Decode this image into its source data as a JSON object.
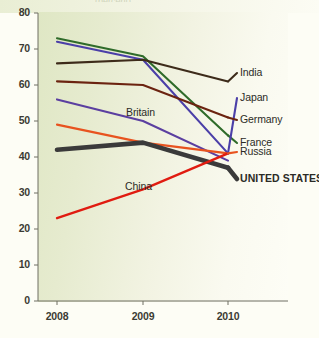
{
  "figure": {
    "background_color": "#fdfdf5",
    "plot_background_color": "#e3e9c8",
    "cropped_title_fragment": "(percent)"
  },
  "axes": {
    "y_ticks": [
      "80",
      "70",
      "60",
      "50",
      "40",
      "30",
      "20",
      "10",
      "0"
    ],
    "x_ticks": [
      "2008",
      "2009",
      "2010"
    ]
  },
  "inline_annotations": [
    {
      "name": "britain-inline-label",
      "text": "Britain"
    },
    {
      "name": "china-inline-label",
      "text": "China"
    }
  ],
  "legend": {
    "position": "right",
    "entries": [
      {
        "label": "India",
        "color": "#3d2b1a"
      },
      {
        "label": "Japan",
        "color": "#4b3fa8"
      },
      {
        "label": "Germany",
        "color": "#6b2310"
      },
      {
        "label": "France",
        "color": "#2f6b2a"
      },
      {
        "label": "Russia",
        "color": "#e8531f"
      },
      {
        "label": "UNITED STATES",
        "color": "#3a3a3a"
      }
    ]
  },
  "chart_data": {
    "type": "line",
    "title": "",
    "subtitle": "",
    "xlabel": "",
    "ylabel": "",
    "x": [
      "2008",
      "2009",
      "2010"
    ],
    "ylim": [
      0,
      80
    ],
    "xlim": [
      "2008",
      "2010"
    ],
    "y_tick_values": [
      0,
      10,
      20,
      30,
      40,
      50,
      60,
      70,
      80
    ],
    "grid": false,
    "legend_position": "right",
    "series": [
      {
        "name": "France",
        "values": [
          73,
          68,
          46
        ],
        "color": "#2f6b2a",
        "width": 2.1,
        "label_kind": "legend"
      },
      {
        "name": "Japan",
        "values": [
          72,
          67,
          41
        ],
        "color": "#4b3fa8",
        "width": 2.1,
        "label_kind": "legend"
      },
      {
        "name": "India",
        "values": [
          66,
          67,
          61
        ],
        "color": "#3d2b1a",
        "width": 2.1,
        "label_kind": "legend"
      },
      {
        "name": "Germany",
        "values": [
          61,
          60,
          51
        ],
        "color": "#6b2310",
        "width": 2.1,
        "label_kind": "legend"
      },
      {
        "name": "Britain",
        "values": [
          56,
          50,
          39
        ],
        "color": "#5b3fa0",
        "width": 2.1,
        "label_kind": "inline"
      },
      {
        "name": "Russia",
        "values": [
          49,
          44,
          41
        ],
        "color": "#e8531f",
        "width": 2.1,
        "label_kind": "legend"
      },
      {
        "name": "UNITED STATES",
        "values": [
          42,
          44,
          37
        ],
        "color": "#3a3a3a",
        "width": 4.6,
        "label_kind": "legend"
      },
      {
        "name": "China",
        "values": [
          23,
          31,
          41
        ],
        "color": "#e01b10",
        "width": 2.3,
        "label_kind": "inline"
      }
    ]
  }
}
